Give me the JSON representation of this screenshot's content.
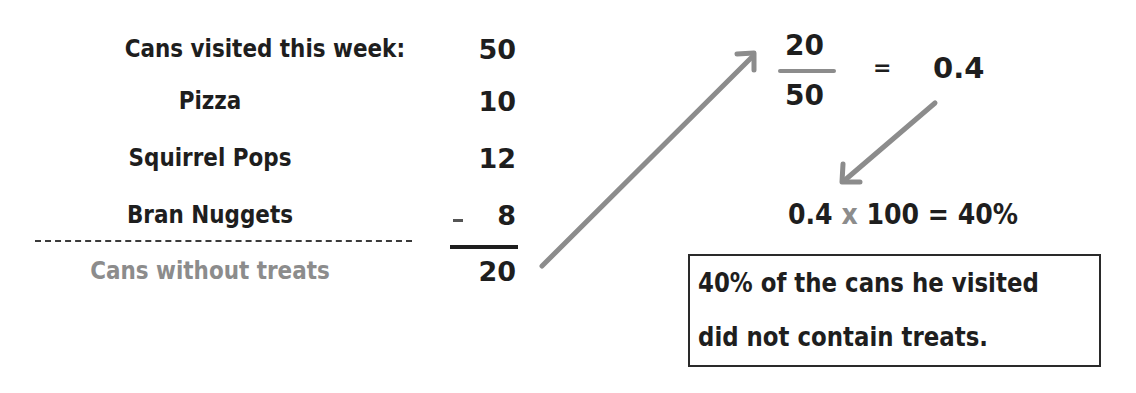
{
  "left_table": {
    "title_label": "Cans visited this week:",
    "title_value": "50",
    "rows": [
      {
        "label": "Pizza",
        "value": "10"
      },
      {
        "label": "Squirrel Pops",
        "value": "12"
      },
      {
        "label": "Bran Nuggets",
        "value": "8",
        "operator": "–"
      }
    ],
    "result_label": "Cans without treats",
    "result_value": "20"
  },
  "fraction": {
    "numerator": "20",
    "denominator": "50",
    "equals": "=",
    "decimal": "0.4"
  },
  "conversion": {
    "left": "0.4",
    "operator": "x",
    "multiplier": "100",
    "equals": "=",
    "result": "40%"
  },
  "conclusion": {
    "line1": "40% of the cans he visited",
    "line2": "did not contain treats."
  },
  "colors": {
    "text": "#1e1e1e",
    "accent_gray": "#8c8c8c",
    "background": "#ffffff"
  }
}
